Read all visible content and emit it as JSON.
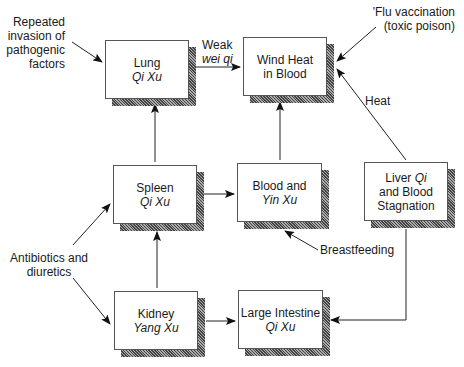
{
  "nodes": {
    "lung": {
      "line1": "Lung",
      "line2": "Qi Xu"
    },
    "wind_heat": {
      "line1": "Wind Heat",
      "line2": "in Blood"
    },
    "spleen": {
      "line1": "Spleen",
      "line2": "Qi Xu"
    },
    "blood_yin": {
      "line1": "Blood and",
      "line2": "Yin Xu"
    },
    "liver": {
      "line1a": "Liver ",
      "line1b": "Qi",
      "line2": "and Blood",
      "line3": "Stagnation"
    },
    "kidney": {
      "line1": "Kidney",
      "line2": "Yang Xu"
    },
    "large_intestine": {
      "line1": "Large Intestine",
      "line2": "Qi Xu"
    }
  },
  "labels": {
    "pathogenic": [
      "Repeated",
      "invasion of",
      "pathogenic",
      "factors"
    ],
    "weak": "Weak",
    "wei_qi": "wei qi",
    "flu": [
      "'Flu vaccination",
      "(toxic poison)"
    ],
    "heat": "Heat",
    "antibiotics": [
      "Antibiotics and",
      "diuretics"
    ],
    "breastfeeding": "Breastfeeding"
  }
}
